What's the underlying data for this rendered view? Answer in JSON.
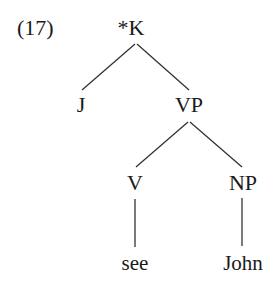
{
  "example_number": "(17)",
  "tree": {
    "root": {
      "label": "*K"
    },
    "nodes": {
      "j": {
        "label": "J"
      },
      "vp": {
        "label": "VP"
      },
      "v": {
        "label": "V"
      },
      "np": {
        "label": "NP"
      },
      "see": {
        "label": "see"
      },
      "john": {
        "label": "John"
      }
    },
    "edges": [
      [
        "*K",
        "J"
      ],
      [
        "*K",
        "VP"
      ],
      [
        "VP",
        "V"
      ],
      [
        "VP",
        "NP"
      ],
      [
        "V",
        "see"
      ],
      [
        "NP",
        "John"
      ]
    ]
  }
}
